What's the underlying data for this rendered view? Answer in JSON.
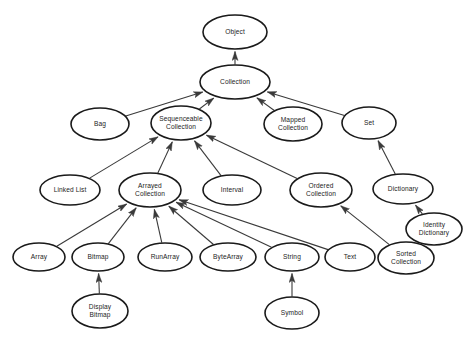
{
  "diagram": {
    "type": "class-inheritance-diagram",
    "node_shape": "ellipse",
    "edge_style": "arrow-to-superclass",
    "colors": {
      "background": "#ffffff",
      "node_fill": "#ffffff",
      "node_stroke": "#1a1a1a",
      "edge_stroke": "#3a3a3a",
      "label_text": "#1c1c1c"
    },
    "nodes": [
      {
        "id": "object",
        "label": "Object",
        "lines": [
          "Object"
        ],
        "cx": 235,
        "cy": 32,
        "rx": 32,
        "ry": 17
      },
      {
        "id": "collection",
        "label": "Collection",
        "lines": [
          "Collection"
        ],
        "cx": 235,
        "cy": 82,
        "rx": 35,
        "ry": 17
      },
      {
        "id": "bag",
        "label": "Bag",
        "lines": [
          "Bag"
        ],
        "cx": 100,
        "cy": 124,
        "rx": 29,
        "ry": 16
      },
      {
        "id": "sequenceable",
        "label": "Sequenceable Collection",
        "lines": [
          "Sequenceable",
          "Collection"
        ],
        "cx": 181,
        "cy": 123,
        "rx": 30,
        "ry": 17
      },
      {
        "id": "mapped",
        "label": "Mapped Collection",
        "lines": [
          "Mapped",
          "Collection"
        ],
        "cx": 293,
        "cy": 124,
        "rx": 29,
        "ry": 17
      },
      {
        "id": "set",
        "label": "Set",
        "lines": [
          "Set"
        ],
        "cx": 369,
        "cy": 123,
        "rx": 27,
        "ry": 16
      },
      {
        "id": "linkedlist",
        "label": "Linked List",
        "lines": [
          "Linked List"
        ],
        "cx": 70,
        "cy": 190,
        "rx": 30,
        "ry": 15
      },
      {
        "id": "arrayedcollection",
        "label": "Arrayed Collection",
        "lines": [
          "Arrayed",
          "Collection"
        ],
        "cx": 150,
        "cy": 190,
        "rx": 31,
        "ry": 17
      },
      {
        "id": "interval",
        "label": "Interval",
        "lines": [
          "Interval"
        ],
        "cx": 232,
        "cy": 190,
        "rx": 29,
        "ry": 15
      },
      {
        "id": "orderedcollection",
        "label": "Ordered Collection",
        "lines": [
          "Ordered",
          "Collection"
        ],
        "cx": 321,
        "cy": 190,
        "rx": 31,
        "ry": 17
      },
      {
        "id": "dictionary",
        "label": "Dictionary",
        "lines": [
          "Dictionary"
        ],
        "cx": 403,
        "cy": 189,
        "rx": 30,
        "ry": 15
      },
      {
        "id": "identitydictionary",
        "label": "Identity Dictionary",
        "lines": [
          "Identity",
          "Dictionary"
        ],
        "cx": 434,
        "cy": 229,
        "rx": 28,
        "ry": 16
      },
      {
        "id": "array",
        "label": "Array",
        "lines": [
          "Array"
        ],
        "cx": 39,
        "cy": 257,
        "rx": 26,
        "ry": 14
      },
      {
        "id": "bitmap",
        "label": "Bitmap",
        "lines": [
          "Bitmap"
        ],
        "cx": 98,
        "cy": 257,
        "rx": 26,
        "ry": 14
      },
      {
        "id": "runarray",
        "label": "RunArray",
        "lines": [
          "RunArray"
        ],
        "cx": 165,
        "cy": 257,
        "rx": 27,
        "ry": 14
      },
      {
        "id": "bytearray",
        "label": "ByteArray",
        "lines": [
          "ByteArray"
        ],
        "cx": 228,
        "cy": 257,
        "rx": 28,
        "ry": 14
      },
      {
        "id": "string",
        "label": "String",
        "lines": [
          "String"
        ],
        "cx": 292,
        "cy": 257,
        "rx": 27,
        "ry": 14
      },
      {
        "id": "text",
        "label": "Text",
        "lines": [
          "Text"
        ],
        "cx": 350,
        "cy": 257,
        "rx": 25,
        "ry": 14
      },
      {
        "id": "sortedcollection",
        "label": "Sorted Collection",
        "lines": [
          "Sorted",
          "Collection"
        ],
        "cx": 406,
        "cy": 258,
        "rx": 28,
        "ry": 16
      },
      {
        "id": "displaybitmap",
        "label": "Display Bitmap",
        "lines": [
          "Display",
          "Bitmap"
        ],
        "cx": 100,
        "cy": 311,
        "rx": 28,
        "ry": 17
      },
      {
        "id": "symbol",
        "label": "Symbol",
        "lines": [
          "Symbol"
        ],
        "cx": 292,
        "cy": 313,
        "rx": 27,
        "ry": 16
      }
    ],
    "edges": [
      {
        "from": "collection",
        "to": "object",
        "label": "Collection inherits Object"
      },
      {
        "from": "bag",
        "to": "collection",
        "label": "Bag inherits Collection"
      },
      {
        "from": "sequenceable",
        "to": "collection",
        "label": "Sequenceable Collection inherits Collection"
      },
      {
        "from": "mapped",
        "to": "collection",
        "label": "Mapped Collection inherits Collection"
      },
      {
        "from": "set",
        "to": "collection",
        "label": "Set inherits Collection"
      },
      {
        "from": "linkedlist",
        "to": "sequenceable",
        "label": "Linked List inherits Sequenceable Collection"
      },
      {
        "from": "arrayedcollection",
        "to": "sequenceable",
        "label": "Arrayed Collection inherits Sequenceable Collection"
      },
      {
        "from": "interval",
        "to": "sequenceable",
        "label": "Interval inherits Sequenceable Collection"
      },
      {
        "from": "orderedcollection",
        "to": "sequenceable",
        "label": "Ordered Collection inherits Sequenceable Collection"
      },
      {
        "from": "dictionary",
        "to": "set",
        "label": "Dictionary inherits Set"
      },
      {
        "from": "identitydictionary",
        "to": "dictionary",
        "label": "Identity Dictionary inherits Dictionary"
      },
      {
        "from": "sortedcollection",
        "to": "orderedcollection",
        "label": "Sorted Collection inherits Ordered Collection"
      },
      {
        "from": "array",
        "to": "arrayedcollection",
        "label": "Array inherits Arrayed Collection"
      },
      {
        "from": "bitmap",
        "to": "arrayedcollection",
        "label": "Bitmap inherits Arrayed Collection"
      },
      {
        "from": "runarray",
        "to": "arrayedcollection",
        "label": "RunArray inherits Arrayed Collection"
      },
      {
        "from": "bytearray",
        "to": "arrayedcollection",
        "label": "ByteArray inherits Arrayed Collection"
      },
      {
        "from": "string",
        "to": "arrayedcollection",
        "label": "String inherits Arrayed Collection"
      },
      {
        "from": "text",
        "to": "arrayedcollection",
        "label": "Text inherits Arrayed Collection"
      },
      {
        "from": "displaybitmap",
        "to": "bitmap",
        "label": "Display Bitmap inherits Bitmap"
      },
      {
        "from": "symbol",
        "to": "string",
        "label": "Symbol inherits String"
      }
    ]
  }
}
